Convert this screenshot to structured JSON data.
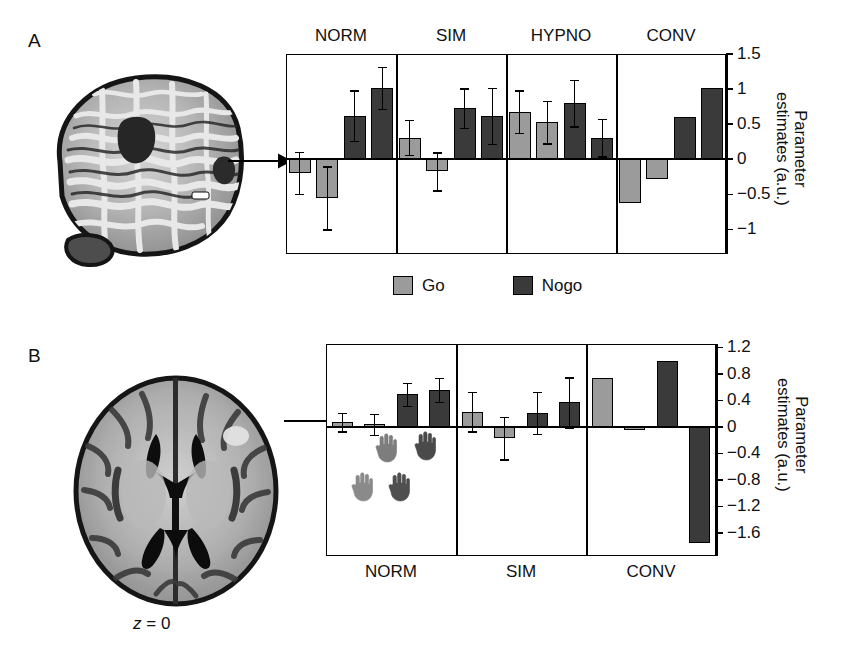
{
  "figure": {
    "panels": [
      {
        "letter": "A"
      },
      {
        "letter": "B"
      }
    ],
    "legend": {
      "items": [
        {
          "label": "Go",
          "color": "#9b9b9b",
          "key": "go"
        },
        {
          "label": "Nogo",
          "color": "#3a3a3a",
          "key": "nogo"
        }
      ]
    },
    "slice_label_prefix": "z",
    "slice_label_eq": "= 0",
    "brain_a_name": "sagittal-brain-mri",
    "brain_b_name": "axial-brain-mri"
  },
  "chart_data": [
    {
      "panel": "A",
      "type": "bar",
      "title": "",
      "xlabel": "",
      "ylabel": "Parameter estimates (a.u.)",
      "ylim": [
        -1.35,
        1.5
      ],
      "yticks": [
        1.5,
        1,
        0.5,
        0,
        -0.5,
        -1
      ],
      "yticklabels": [
        "1.5",
        "1",
        "0.5",
        "0",
        "−0.5",
        "−1"
      ],
      "grid": false,
      "legend_position": "below",
      "groups": [
        "NORM",
        "SIM",
        "HYPNO",
        "CONV"
      ],
      "bars": [
        {
          "group": "NORM",
          "series": "Go",
          "value": -0.19,
          "err": 0.3
        },
        {
          "group": "NORM",
          "series": "Go",
          "value": -0.55,
          "err": 0.45
        },
        {
          "group": "NORM",
          "series": "Nogo",
          "value": 0.62,
          "err": 0.36
        },
        {
          "group": "NORM",
          "series": "Nogo",
          "value": 1.02,
          "err": 0.3
        },
        {
          "group": "SIM",
          "series": "Go",
          "value": 0.31,
          "err": 0.25
        },
        {
          "group": "SIM",
          "series": "Go",
          "value": -0.17,
          "err": 0.27
        },
        {
          "group": "SIM",
          "series": "Nogo",
          "value": 0.73,
          "err": 0.28
        },
        {
          "group": "SIM",
          "series": "Nogo",
          "value": 0.62,
          "err": 0.4
        },
        {
          "group": "HYPNO",
          "series": "Go",
          "value": 0.68,
          "err": 0.3
        },
        {
          "group": "HYPNO",
          "series": "Go",
          "value": 0.53,
          "err": 0.3
        },
        {
          "group": "HYPNO",
          "series": "Nogo",
          "value": 0.8,
          "err": 0.33
        },
        {
          "group": "HYPNO",
          "series": "Nogo",
          "value": 0.31,
          "err": 0.27
        },
        {
          "group": "CONV",
          "series": "Go",
          "value": -0.62,
          "err": 0
        },
        {
          "group": "CONV",
          "series": "Go",
          "value": -0.28,
          "err": 0
        },
        {
          "group": "CONV",
          "series": "Nogo",
          "value": 0.6,
          "err": 0
        },
        {
          "group": "CONV",
          "series": "Nogo",
          "value": 1.02,
          "err": 0
        }
      ]
    },
    {
      "panel": "B",
      "type": "bar",
      "title": "",
      "xlabel": "",
      "ylabel": "Parameter estimates (a.u.)",
      "ylim": [
        -1.95,
        1.25
      ],
      "yticks": [
        1.2,
        0.8,
        0.4,
        0,
        -0.4,
        -0.8,
        -1.2,
        -1.6
      ],
      "yticklabels": [
        "1.2",
        "0.8",
        "0.4",
        "0",
        "−0.4",
        "−0.8",
        "−1.2",
        "−1.6"
      ],
      "grid": false,
      "legend_position": "none",
      "groups": [
        "NORM",
        "SIM",
        "CONV"
      ],
      "bars": [
        {
          "group": "NORM",
          "series": "Go",
          "value": 0.07,
          "err": 0.14
        },
        {
          "group": "NORM",
          "series": "Go",
          "value": 0.04,
          "err": 0.16
        },
        {
          "group": "NORM",
          "series": "Nogo",
          "value": 0.49,
          "err": 0.17
        },
        {
          "group": "NORM",
          "series": "Nogo",
          "value": 0.56,
          "err": 0.18
        },
        {
          "group": "SIM",
          "series": "Go",
          "value": 0.23,
          "err": 0.3
        },
        {
          "group": "SIM",
          "series": "Go",
          "value": -0.17,
          "err": 0.32
        },
        {
          "group": "SIM",
          "series": "Nogo",
          "value": 0.21,
          "err": 0.32
        },
        {
          "group": "SIM",
          "series": "Nogo",
          "value": 0.37,
          "err": 0.38
        },
        {
          "group": "CONV",
          "series": "Go",
          "value": 0.74,
          "err": 0
        },
        {
          "group": "CONV",
          "series": "Go",
          "value": -0.05,
          "err": 0
        },
        {
          "group": "CONV",
          "series": "Nogo",
          "value": 1.0,
          "err": 0
        },
        {
          "group": "CONV",
          "series": "Nogo",
          "value": -1.75,
          "err": 0
        }
      ],
      "inset_hands": [
        {
          "shade": "#7d7d7d"
        },
        {
          "shade": "#4a4a4a"
        },
        {
          "shade": "#8a8a8a"
        },
        {
          "shade": "#4f4f4f"
        }
      ]
    }
  ]
}
